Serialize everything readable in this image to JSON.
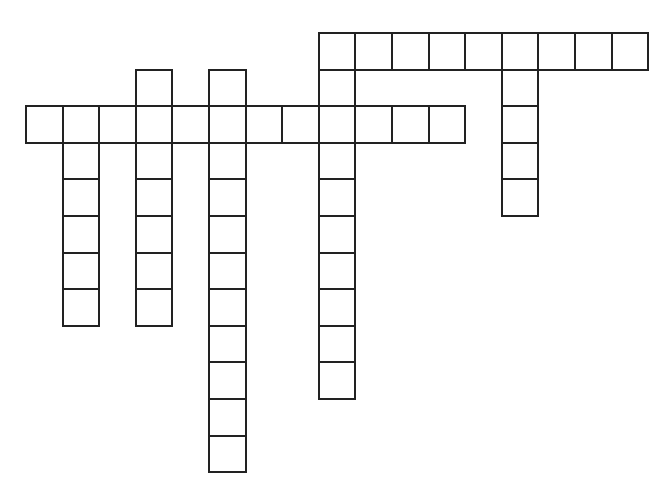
{
  "puzzle": {
    "type": "crossword",
    "origin_x": 25,
    "origin_y": 32,
    "cell_size": 36.6,
    "border_color": "#222222",
    "cell_fill": "#ffffff",
    "entries": [
      {
        "id": "across-top",
        "direction": "across",
        "row": 0,
        "col": 8,
        "length": 9
      },
      {
        "id": "across-middle",
        "direction": "across",
        "row": 2,
        "col": 0,
        "length": 12
      },
      {
        "id": "down-col1",
        "direction": "down",
        "row": 2,
        "col": 1,
        "length": 6
      },
      {
        "id": "down-col3",
        "direction": "down",
        "row": 1,
        "col": 3,
        "length": 7
      },
      {
        "id": "down-col5",
        "direction": "down",
        "row": 1,
        "col": 5,
        "length": 11
      },
      {
        "id": "down-col8",
        "direction": "down",
        "row": 0,
        "col": 8,
        "length": 10
      },
      {
        "id": "down-col13",
        "direction": "down",
        "row": 0,
        "col": 13,
        "length": 5
      }
    ]
  }
}
